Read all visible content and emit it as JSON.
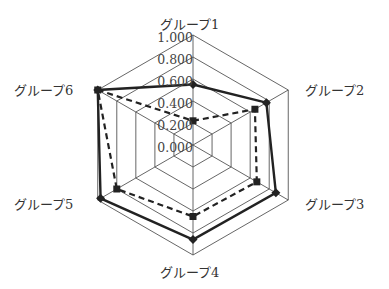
{
  "chart_data": {
    "type": "radar",
    "title": "",
    "categories": [
      "グループ1",
      "グループ2",
      "グループ3",
      "グループ4",
      "グループ5",
      "グループ6"
    ],
    "radial_ticks": [
      "0.000",
      "0.200",
      "0.400",
      "0.600",
      "0.800",
      "1.000"
    ],
    "rlim": [
      0,
      1.0
    ],
    "grid": true,
    "legend": null,
    "series": [
      {
        "name": "series-solid",
        "style": "solid",
        "marker": "diamond",
        "color": "#222222",
        "values": [
          0.55,
          0.77,
          0.87,
          0.86,
          0.97,
          1.0
        ]
      },
      {
        "name": "series-dashed",
        "style": "dashed",
        "marker": "square",
        "color": "#222222",
        "values": [
          0.22,
          0.65,
          0.67,
          0.65,
          0.8,
          1.0
        ]
      }
    ]
  },
  "colors": {
    "grid": "#555555",
    "line": "#222222",
    "text": "#333333"
  }
}
